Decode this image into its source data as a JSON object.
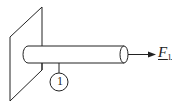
{
  "diagram": {
    "type": "cantilever-rod",
    "elements": {
      "wall": {
        "kind": "parallelogram-support"
      },
      "rod": {
        "kind": "cylinder",
        "fixed_end": "wall"
      },
      "force": {
        "label_main": "F",
        "label_sub": "1",
        "direction": "right",
        "underlined": true
      },
      "member_tag": {
        "label": "1"
      }
    },
    "colors": {
      "stroke": "#222222",
      "fill": "#ffffff"
    }
  }
}
